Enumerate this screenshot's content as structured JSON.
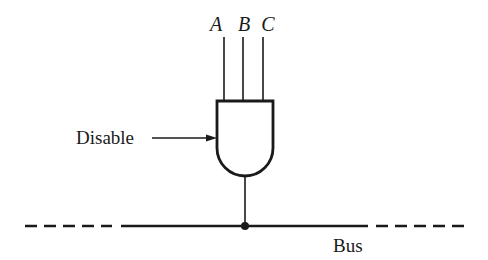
{
  "diagram": {
    "type": "logic-gate-bus",
    "gate": {
      "kind": "AND",
      "inputs": [
        "A",
        "B",
        "C"
      ]
    },
    "labels": {
      "input_a": "A",
      "input_b": "B",
      "input_c": "C",
      "disable": "Disable",
      "bus": "Bus"
    },
    "colors": {
      "ink": "#1a1a1a",
      "background": "#ffffff"
    }
  }
}
